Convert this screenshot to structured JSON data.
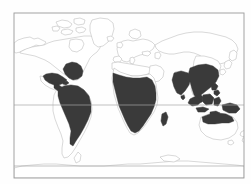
{
  "figure": {
    "kind": "world-distribution-map",
    "projection": "cylindrical",
    "title": "",
    "caption": "",
    "background_color": "#fefefe"
  },
  "style": {
    "frame_color": "#9a9a9a",
    "frame_width": 0.8,
    "coastline_color": "#b9b9b9",
    "coastline_width": 0.55,
    "latitude_line_color": "#a8a8a8",
    "latitude_line_width": 0.7,
    "range_fill_color": "#3a3a3a",
    "range_stroke_color": "#3a3a3a",
    "ocean_color": "#fefefe",
    "land_color": "#ffffff"
  },
  "frame": {
    "left": 14,
    "top": 13,
    "right": 244,
    "bottom": 178,
    "width": 230,
    "height": 165
  },
  "latitude_lines": [
    {
      "name": "tropic-of-cancer",
      "y": 70,
      "label": ""
    },
    {
      "name": "equator",
      "y": 105,
      "label": ""
    },
    {
      "name": "tropic-of-capricorn",
      "y": 140,
      "label": ""
    },
    {
      "name": "antarctic-line",
      "y": 166,
      "label": ""
    }
  ],
  "legend": {
    "visible": false,
    "entries": [
      {
        "label": "Distribution range",
        "color": "#3a3a3a"
      }
    ]
  },
  "axis_labels": {
    "x": "",
    "y": "",
    "tick_labels": []
  },
  "regions_shaded": [
    "southeastern-north-america",
    "mexico",
    "central-america",
    "caribbean",
    "northern-south-america",
    "amazon-basin",
    "brazil",
    "sub-saharan-africa",
    "madagascar",
    "indian-subcontinent",
    "indochina",
    "southern-china",
    "indonesia",
    "philippines",
    "new-guinea",
    "northern-australia"
  ],
  "regions_unshaded": [
    "canada",
    "alaska",
    "greenland",
    "europe",
    "north-africa-sahara",
    "siberia",
    "central-asia",
    "southern-south-america",
    "southern-australia",
    "antarctica"
  ],
  "chart_data": {
    "type": "map",
    "title": "",
    "xlabel": "",
    "ylabel": "",
    "legend_position": "none",
    "grid": false,
    "xlim": [
      -180,
      180
    ],
    "ylim": [
      -90,
      90
    ],
    "series": [
      {
        "name": "Distribution range",
        "color": "#3a3a3a",
        "values": [
          {
            "region": "southeastern-north-america",
            "present": 1
          },
          {
            "region": "mexico",
            "present": 1
          },
          {
            "region": "central-america",
            "present": 1
          },
          {
            "region": "caribbean",
            "present": 1
          },
          {
            "region": "northern-south-america",
            "present": 1
          },
          {
            "region": "amazon-basin",
            "present": 1
          },
          {
            "region": "brazil",
            "present": 1
          },
          {
            "region": "southern-south-america",
            "present": 0
          },
          {
            "region": "sub-saharan-africa",
            "present": 1
          },
          {
            "region": "madagascar",
            "present": 1
          },
          {
            "region": "north-africa-sahara",
            "present": 0
          },
          {
            "region": "europe",
            "present": 0
          },
          {
            "region": "indian-subcontinent",
            "present": 1
          },
          {
            "region": "indochina",
            "present": 1
          },
          {
            "region": "southern-china",
            "present": 1
          },
          {
            "region": "indonesia",
            "present": 1
          },
          {
            "region": "philippines",
            "present": 1
          },
          {
            "region": "new-guinea",
            "present": 1
          },
          {
            "region": "northern-australia",
            "present": 1
          },
          {
            "region": "southern-australia",
            "present": 0
          },
          {
            "region": "siberia",
            "present": 0
          },
          {
            "region": "canada",
            "present": 0
          },
          {
            "region": "greenland",
            "present": 0
          },
          {
            "region": "antarctica",
            "present": 0
          }
        ]
      }
    ],
    "annotations": []
  }
}
